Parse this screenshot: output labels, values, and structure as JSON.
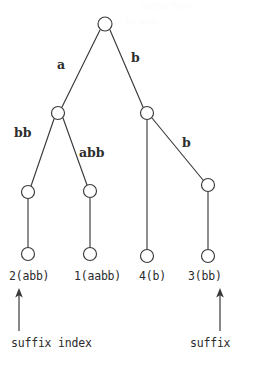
{
  "figure": {
    "name": "suffix-tree-diagram",
    "ink_color": "#333333",
    "background_color": "#ffffff",
    "width": 257,
    "height": 366
  },
  "tree": {
    "root": {
      "id": "root",
      "cx": 105,
      "cy": 24,
      "r": 7
    },
    "internal_nodes": [
      {
        "id": "n-a",
        "cx": 58,
        "cy": 113,
        "r": 6.5
      },
      {
        "id": "n-b",
        "cx": 147,
        "cy": 113,
        "r": 6.5
      },
      {
        "id": "n-a-bb",
        "cx": 28,
        "cy": 192,
        "r": 6.5
      },
      {
        "id": "n-a-abb",
        "cx": 90,
        "cy": 191,
        "r": 6.5
      },
      {
        "id": "n-b-b",
        "cx": 208,
        "cy": 185,
        "r": 6.5
      }
    ],
    "leaf_nodes": [
      {
        "id": "leaf-2",
        "cx": 28,
        "cy": 254,
        "r": 6.5
      },
      {
        "id": "leaf-1",
        "cx": 90,
        "cy": 254,
        "r": 6.5
      },
      {
        "id": "leaf-4",
        "cx": 147,
        "cy": 256,
        "r": 6.5
      },
      {
        "id": "leaf-3",
        "cx": 208,
        "cy": 256,
        "r": 6.5
      }
    ],
    "edges": [
      {
        "id": "edge-root-a",
        "from": "root",
        "to": "n-a",
        "label": "a"
      },
      {
        "id": "edge-root-b",
        "from": "root",
        "to": "n-b",
        "label": "b"
      },
      {
        "id": "edge-a-bb",
        "from": "n-a",
        "to": "n-a-bb",
        "label": "bb"
      },
      {
        "id": "edge-a-abb",
        "from": "n-a",
        "to": "n-a-abb",
        "label": "abb"
      },
      {
        "id": "edge-b-down",
        "from": "n-b",
        "to": "leaf-4",
        "label": ""
      },
      {
        "id": "edge-b-b",
        "from": "n-b",
        "to": "n-b-b",
        "label": "b"
      },
      {
        "id": "edge-bb-leaf",
        "from": "n-a-bb",
        "to": "leaf-2",
        "label": ""
      },
      {
        "id": "edge-abb-leaf",
        "from": "n-a-abb",
        "to": "leaf-1",
        "label": ""
      },
      {
        "id": "edge-bb2-leaf",
        "from": "n-b-b",
        "to": "leaf-3",
        "label": ""
      }
    ],
    "edge_labels": [
      {
        "id": "label-a",
        "text": "a",
        "x": 57,
        "y": 59
      },
      {
        "id": "label-b",
        "text": "b",
        "x": 131,
        "y": 52
      },
      {
        "id": "label-bb",
        "text": "bb",
        "x": 14,
        "y": 127
      },
      {
        "id": "label-abb",
        "text": "abb",
        "x": 79,
        "y": 147
      },
      {
        "id": "label-b2",
        "text": "b",
        "x": 182,
        "y": 137
      }
    ],
    "leaf_labels": [
      {
        "id": "leaf-label-2",
        "text": "2(abb)",
        "x": 9,
        "y": 271
      },
      {
        "id": "leaf-label-1",
        "text": "1(aabb)",
        "x": 74,
        "y": 271
      },
      {
        "id": "leaf-label-4",
        "text": "4(b)",
        "x": 139,
        "y": 271
      },
      {
        "id": "leaf-label-3",
        "text": "3(bb)",
        "x": 188,
        "y": 271
      }
    ]
  },
  "annotations": {
    "arrows": [
      {
        "id": "arrow-suffix-index",
        "x": 19,
        "y_tail": 331,
        "y_head": 290
      },
      {
        "id": "arrow-suffix",
        "x": 220,
        "y_tail": 331,
        "y_head": 290
      }
    ],
    "captions": [
      {
        "id": "caption-suffix-index",
        "text": "suffix index",
        "x": 11,
        "y": 338
      },
      {
        "id": "caption-suffix",
        "text": "suffix",
        "x": 190,
        "y": 338
      }
    ]
  },
  "bleed_through": {
    "visible": true,
    "lines": [
      {
        "id": "ghost-line-1",
        "text": "Suffix Tree",
        "x": 140,
        "y": 1,
        "size": 11
      },
      {
        "id": "ghost-line-2",
        "text": "for aabb",
        "x": 125,
        "y": 16,
        "size": 10
      }
    ]
  }
}
